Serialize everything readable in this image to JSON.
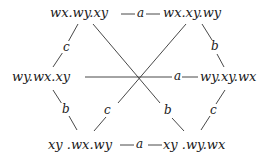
{
  "diagram": {
    "nodes": [
      {
        "id": "top-left",
        "label": "wx.wy.xy"
      },
      {
        "id": "top-right",
        "label": "wx.xy.wy"
      },
      {
        "id": "mid-left",
        "label": "wy.wx.xy"
      },
      {
        "id": "mid-right",
        "label": "wy.xy.wx"
      },
      {
        "id": "bottom-left",
        "label": "xy .wx.wy"
      },
      {
        "id": "bottom-right",
        "label": "xy .wy.wx"
      }
    ],
    "edges": [
      {
        "from": "top-left",
        "to": "top-right",
        "label": "a"
      },
      {
        "from": "mid-left",
        "to": "mid-right",
        "label": "a"
      },
      {
        "from": "bottom-left",
        "to": "bottom-right",
        "label": "a"
      },
      {
        "from": "top-left",
        "to": "mid-left",
        "label": "c"
      },
      {
        "from": "top-right",
        "to": "mid-right",
        "label": "b"
      },
      {
        "from": "mid-left",
        "to": "bottom-left",
        "label": "b"
      },
      {
        "from": "mid-right",
        "to": "bottom-right",
        "label": "c"
      },
      {
        "from": "top-left",
        "to": "bottom-right",
        "label": "b"
      },
      {
        "from": "top-right",
        "to": "bottom-left",
        "label": "c"
      }
    ]
  }
}
